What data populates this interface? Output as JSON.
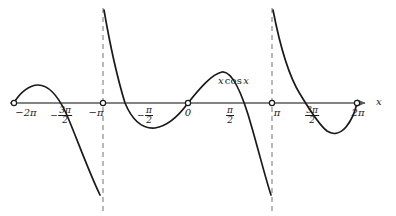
{
  "figure": {
    "kind": "function-graph",
    "background_color": "#ffffff",
    "width": 396,
    "height": 216,
    "axis_color": "#5a5a5a",
    "curve_color": "#1a1a1a",
    "dash_color": "#8a8a8a",
    "text_color": "#1a1a1a"
  },
  "axis": {
    "name": "x",
    "baseline_y": 103,
    "start_x": 10,
    "end_x": 365,
    "arrow": true
  },
  "curve_label": {
    "variable_1": "x",
    "operator": "cos",
    "variable_2": "x",
    "x": 218,
    "y": 82
  },
  "tick_labels": [
    {
      "id": "neg-two-pi",
      "text": "−2π",
      "kind": "plain",
      "x": 26,
      "y": 108
    },
    {
      "id": "neg-three-pi-over-two",
      "kind": "fraction",
      "sign": "−",
      "numerator": "3π",
      "denominator": "2",
      "x": 61,
      "y": 106
    },
    {
      "id": "neg-pi",
      "text": "−π",
      "kind": "plain",
      "x": 96,
      "y": 108
    },
    {
      "id": "neg-pi-over-two",
      "kind": "fraction",
      "sign": "−",
      "numerator": "π",
      "denominator": "2",
      "x": 145,
      "y": 106
    },
    {
      "id": "zero",
      "text": "0",
      "kind": "plain",
      "x": 188,
      "y": 108
    },
    {
      "id": "pi-over-two",
      "kind": "fraction",
      "sign": "",
      "numerator": "π",
      "denominator": "2",
      "x": 230,
      "y": 106
    },
    {
      "id": "pi",
      "text": "π",
      "kind": "plain",
      "x": 277,
      "y": 108
    },
    {
      "id": "three-pi-over-two",
      "kind": "fraction",
      "sign": "",
      "numerator": "3π",
      "denominator": "2",
      "x": 312,
      "y": 106
    },
    {
      "id": "two-pi",
      "text": "2π",
      "kind": "plain",
      "x": 358,
      "y": 108
    }
  ],
  "dashed_lines": [
    {
      "id": "dash-neg-pi",
      "x": 103,
      "y_top": 8,
      "y_bottom": 212
    },
    {
      "id": "dash-pi",
      "x": 272,
      "y_top": 8,
      "y_bottom": 212
    }
  ],
  "open_points": [
    {
      "id": "open-neg-two-pi",
      "x": 14,
      "y": 103
    },
    {
      "id": "open-neg-pi",
      "x": 103,
      "y": 103
    },
    {
      "id": "open-zero",
      "x": 188,
      "y": 103
    },
    {
      "id": "open-pi",
      "x": 272,
      "y": 103
    },
    {
      "id": "open-two-pi",
      "x": 357,
      "y": 103
    }
  ],
  "curve_segments": [
    {
      "id": "segment-left",
      "path": "M 14 103 C 20 92, 30 85, 38 85 C 48 85, 58 96, 66 113 C 76 136, 88 170, 100 195"
    },
    {
      "id": "segment-middle",
      "path": "M 104 10 C 110 45, 118 80, 125 103 C 133 122, 144 129, 155 128 C 168 126, 180 114, 188 103 C 200 88, 212 74, 222 72 C 232 71, 242 92, 252 128 C 260 156, 266 180, 271 195"
    },
    {
      "id": "segment-right",
      "path": "M 273 10 C 280 46, 290 78, 300 94 C 308 107, 318 124, 327 131 C 333 135, 340 134, 346 127 C 351 121, 355 112, 357 103"
    }
  ],
  "chart_data": {
    "type": "line",
    "title": "",
    "expression": "x cos x",
    "xlabel": "x",
    "ylabel": "",
    "grid": false,
    "legend": "none",
    "xlim": [
      -6.2832,
      6.2832
    ],
    "x_ticks": [
      {
        "value": -6.2832,
        "label": "−2π"
      },
      {
        "value": -4.7124,
        "label": "−3π/2"
      },
      {
        "value": -3.1416,
        "label": "−π"
      },
      {
        "value": -1.5708,
        "label": "−π/2"
      },
      {
        "value": 0,
        "label": "0"
      },
      {
        "value": 1.5708,
        "label": "π/2"
      },
      {
        "value": 3.1416,
        "label": "π"
      },
      {
        "value": 4.7124,
        "label": "3π/2"
      },
      {
        "value": 6.2832,
        "label": "2π"
      }
    ],
    "zeros_marked": [
      -6.2832,
      -3.1416,
      0,
      3.1416,
      6.2832
    ],
    "dashed_verticals": [
      -3.1416,
      3.1416
    ],
    "series": [
      {
        "name": "x cos x",
        "x": [
          -6.2832,
          -5.8,
          -5.5,
          -5.2,
          -4.7124,
          -4.4,
          -4.0,
          -3.6,
          -3.1416,
          -3.1416,
          -2.8,
          -2.4,
          -1.9,
          -1.5708,
          -1.2,
          -0.8,
          -0.4,
          0,
          0.4,
          0.8,
          1.2,
          1.5708,
          1.9,
          2.4,
          2.8,
          3.1416,
          3.1416,
          3.6,
          4.0,
          4.4,
          4.7124,
          5.2,
          5.5,
          5.8,
          6.2832
        ],
        "y": [
          -6.2832,
          -5.26,
          -3.9,
          -2.42,
          0,
          1.33,
          2.62,
          3.2,
          3.1416,
          3.1416,
          2.64,
          1.77,
          0.63,
          0,
          -0.43,
          -0.56,
          -0.37,
          0,
          0.37,
          0.56,
          0.43,
          0,
          -0.63,
          -1.77,
          -2.64,
          -3.1416,
          -3.1416,
          -3.2,
          -2.62,
          -1.33,
          0,
          2.42,
          3.9,
          5.26,
          6.2832
        ]
      }
    ]
  }
}
